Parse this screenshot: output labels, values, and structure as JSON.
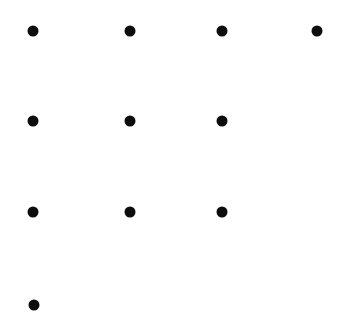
{
  "canvas": {
    "width": 339,
    "height": 313,
    "background_color": "#ffffff"
  },
  "chart_data": {
    "type": "scatter",
    "title": "",
    "subtitle": "",
    "xlabel": "",
    "ylabel": "",
    "grid": false,
    "legend": null,
    "axes_visible": false,
    "tick_labels_x": [],
    "tick_labels_y": [],
    "xlim": [
      0,
      339
    ],
    "ylim": [
      0,
      313
    ],
    "marker": {
      "shape": "circle",
      "color": "#0d0d0d",
      "diameter_px": 11
    },
    "columns_x": [
      33,
      130,
      222,
      317
    ],
    "rows_y": [
      31,
      121,
      212,
      305
    ],
    "counts_per_row": [
      4,
      3,
      3,
      1
    ],
    "points": [
      {
        "id": "r1c1",
        "x": 33,
        "y": 31,
        "row": 1,
        "col": 1
      },
      {
        "id": "r1c2",
        "x": 130,
        "y": 31,
        "row": 1,
        "col": 2
      },
      {
        "id": "r1c3",
        "x": 222,
        "y": 31,
        "row": 1,
        "col": 3
      },
      {
        "id": "r1c4",
        "x": 317,
        "y": 31,
        "row": 1,
        "col": 4
      },
      {
        "id": "r2c1",
        "x": 33,
        "y": 121,
        "row": 2,
        "col": 1
      },
      {
        "id": "r2c2",
        "x": 130,
        "y": 121,
        "row": 2,
        "col": 2
      },
      {
        "id": "r2c3",
        "x": 222,
        "y": 121,
        "row": 2,
        "col": 3
      },
      {
        "id": "r3c1",
        "x": 33,
        "y": 212,
        "row": 3,
        "col": 1
      },
      {
        "id": "r3c2",
        "x": 130,
        "y": 212,
        "row": 3,
        "col": 2
      },
      {
        "id": "r3c3",
        "x": 222,
        "y": 212,
        "row": 3,
        "col": 3
      },
      {
        "id": "r4c1",
        "x": 34,
        "y": 305,
        "row": 4,
        "col": 1
      }
    ]
  }
}
